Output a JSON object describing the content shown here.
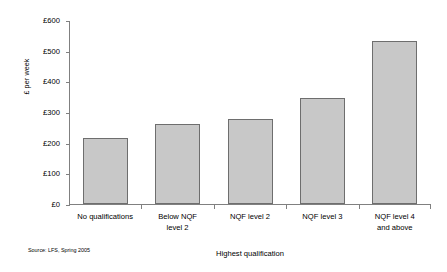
{
  "chart_data": {
    "type": "bar",
    "title": "",
    "subtitle": "",
    "xlabel": "Highest qualification",
    "ylabel": "£ per week",
    "categories": [
      "No qualifications",
      "Below NQF level 2",
      "NQF level 2",
      "NQF level 3",
      "NQF level 4 and above"
    ],
    "category_lines": [
      [
        "No qualifications"
      ],
      [
        "Below NQF",
        "level 2"
      ],
      [
        "NQF level 2"
      ],
      [
        "NQF level 3"
      ],
      [
        "NQF level 4",
        "and above"
      ]
    ],
    "values": [
      215,
      260,
      278,
      345,
      530
    ],
    "ylim": [
      0,
      600
    ],
    "ytick_values": [
      0,
      100,
      200,
      300,
      400,
      500,
      600
    ],
    "ytick_labels": [
      "£0",
      "£100",
      "£200",
      "£300",
      "£400",
      "£500",
      "£600"
    ],
    "grid": false,
    "legend": false,
    "legend_position": "none",
    "bar_fill_color": "#c8c8c8",
    "bar_border_color": "#6e6e6e",
    "axis_color": "#808080",
    "background_color": "#ffffff"
  },
  "annotations": {
    "source": "Source: LFS, Spring 2005"
  }
}
